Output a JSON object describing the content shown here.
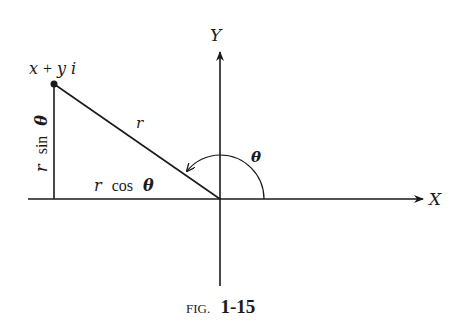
{
  "figure": {
    "caption_prefix": "FIG.",
    "caption_number": "1-15",
    "colors": {
      "ink": "#1a1a1a",
      "background": "#ffffff"
    }
  },
  "axes": {
    "x_label": "X",
    "y_label": "Y"
  },
  "labels": {
    "point": "x + yi",
    "point_x": "x",
    "point_plus": "+",
    "point_y": "y",
    "point_i": "i",
    "radius": "r",
    "angle": "θ",
    "horizontal_leg_r": "r",
    "horizontal_leg_fn": "cos",
    "horizontal_leg_theta": "θ",
    "vertical_leg_r": "r",
    "vertical_leg_fn": "sin",
    "vertical_leg_theta": "θ"
  }
}
